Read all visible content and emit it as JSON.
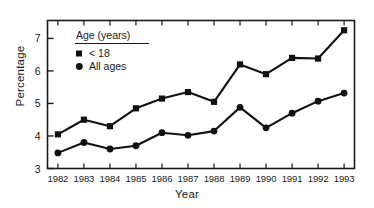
{
  "chart_data": {
    "type": "line",
    "title": "",
    "xlabel": "Year",
    "ylabel": "Percentage",
    "categories": [
      "1982",
      "1983",
      "1984",
      "1985",
      "1986",
      "1987",
      "1988",
      "1989",
      "1990",
      "1991",
      "1992",
      "1993"
    ],
    "x": [
      1982,
      1983,
      1984,
      1985,
      1986,
      1987,
      1988,
      1989,
      1990,
      1991,
      1992,
      1993
    ],
    "xlim": [
      1981.6,
      1993.4
    ],
    "ylim": [
      3,
      7.55
    ],
    "yticks": [
      3,
      4,
      5,
      6,
      7
    ],
    "ytick_labels": [
      "3",
      "4",
      "5",
      "6",
      "7"
    ],
    "grid": false,
    "legend_position": "upper-left-inside",
    "legend_title": "Age (years)",
    "series": [
      {
        "name": "< 18",
        "marker": "square",
        "color": "#111111",
        "values": [
          4.05,
          4.5,
          4.3,
          4.85,
          5.15,
          5.35,
          5.05,
          6.2,
          5.9,
          6.4,
          6.38,
          7.25
        ]
      },
      {
        "name": "All ages",
        "marker": "circle",
        "color": "#111111",
        "values": [
          3.48,
          3.8,
          3.6,
          3.7,
          4.1,
          4.02,
          4.15,
          4.88,
          4.25,
          4.7,
          5.07,
          5.32
        ]
      }
    ]
  },
  "legend": {
    "title": "Age (years)",
    "entries": [
      {
        "label": "< 18",
        "marker": "square"
      },
      {
        "label": "All ages",
        "marker": "circle"
      }
    ]
  },
  "axes": {
    "y_title": "Percentage",
    "x_title": "Year"
  },
  "colors": {
    "line": "#111111",
    "frame": "#1a1a1a",
    "background": "#ffffff"
  }
}
